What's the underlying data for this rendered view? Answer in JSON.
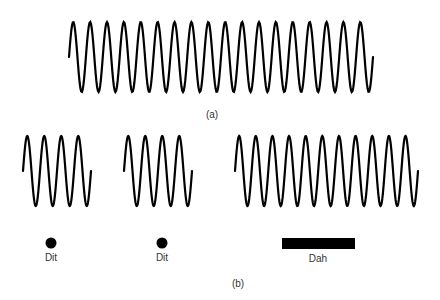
{
  "figure": {
    "panel_a": {
      "label": "(a)",
      "wave": {
        "x_start": 69,
        "x_end": 373,
        "y_mid": 57,
        "amplitude": 35,
        "cycles": 18,
        "description": "continuous carrier wave"
      }
    },
    "panel_b": {
      "label": "(b)",
      "elements": [
        {
          "type": "dit",
          "label": "Dit",
          "wave": {
            "x_start": 23,
            "x_end": 91,
            "y_mid": 171,
            "amplitude": 35,
            "cycles": 4
          },
          "symbol": {
            "shape": "dot",
            "cx": 51,
            "cy": 243
          },
          "label_x": 51
        },
        {
          "type": "dit",
          "label": "Dit",
          "wave": {
            "x_start": 124,
            "x_end": 192,
            "y_mid": 171,
            "amplitude": 35,
            "cycles": 4
          },
          "symbol": {
            "shape": "dot",
            "cx": 162,
            "cy": 243
          },
          "label_x": 162
        },
        {
          "type": "dah",
          "label": "Dah",
          "wave": {
            "x_start": 235,
            "x_end": 418,
            "y_mid": 171,
            "amplitude": 35,
            "cycles": 11
          },
          "symbol": {
            "shape": "bar",
            "x": 282,
            "y": 238,
            "w": 73,
            "h": 11
          },
          "label_x": 318
        }
      ]
    },
    "colors": {
      "stroke": "#000000",
      "text": "#333333",
      "background": "#ffffff"
    }
  }
}
